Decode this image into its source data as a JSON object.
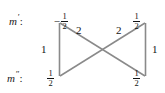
{
  "diagram": {
    "type": "transition-crossing-diagram",
    "line_color": "#7a7a7a",
    "text_color": "#141414",
    "background": "#ffffff",
    "rows": [
      {
        "id": "upper",
        "label_base": "m",
        "label_prime": "′",
        "label_colon": ":"
      },
      {
        "id": "lower",
        "label_base": "m",
        "label_prime": "″",
        "label_colon": ":"
      }
    ],
    "nodes": [
      {
        "id": "top-left",
        "row": "upper",
        "sign": "−",
        "numerator": "1",
        "denominator": "2",
        "value": "-1/2"
      },
      {
        "id": "top-right",
        "row": "upper",
        "sign": "",
        "numerator": "1",
        "denominator": "2",
        "value": "1/2"
      },
      {
        "id": "bottom-left",
        "row": "lower",
        "sign": "",
        "numerator": "1",
        "denominator": "2",
        "value": "1/2"
      },
      {
        "id": "bottom-right",
        "row": "lower",
        "sign": "",
        "numerator": "1",
        "denominator": "2",
        "value": "1/2"
      }
    ],
    "edges": [
      {
        "id": "left-vertical",
        "from": "top-left",
        "to": "bottom-left",
        "label": "1"
      },
      {
        "id": "right-vertical",
        "from": "top-right",
        "to": "bottom-right",
        "label": "1"
      },
      {
        "id": "diagonal-left",
        "from": "top-left",
        "to": "bottom-right",
        "label": "2"
      },
      {
        "id": "diagonal-right",
        "from": "top-right",
        "to": "bottom-left",
        "label": "2"
      }
    ]
  }
}
